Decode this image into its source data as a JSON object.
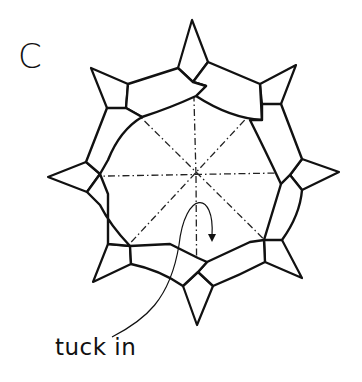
{
  "diagram": {
    "step_label": "C",
    "annotation": "tuck in",
    "points": 8,
    "colors": {
      "line": "#111111",
      "background": "#ffffff"
    },
    "icons": [
      "mountain-fold-line",
      "tuck-arrow"
    ]
  }
}
